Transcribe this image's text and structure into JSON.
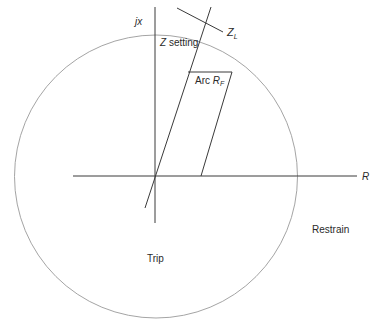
{
  "diagram": {
    "labels": {
      "jx_axis": "jx",
      "r_axis": "R",
      "z_setting_prefix": "Z",
      "z_setting_suffix": " setting",
      "zl_main": "Z",
      "zl_sub": "L",
      "arc_prefix": "Arc ",
      "arc_main": "R",
      "arc_sub": "F",
      "restrain": "Restrain",
      "trip": "Trip"
    },
    "colors": {
      "line": "#3a3a3a",
      "circle": "#9a9a9a",
      "background": "#ffffff"
    },
    "geometry": {
      "circle": {
        "cx": 156,
        "cy": 176.5,
        "r": 141.5
      },
      "origin": [
        155,
        176
      ],
      "r_axis": {
        "x1": 73,
        "x2": 357,
        "y": 176
      },
      "jx_axis": {
        "x": 155,
        "y1": 7,
        "y2": 223
      },
      "zl_line": {
        "x1": 145,
        "y1": 208,
        "x2": 211,
        "y2": 7
      },
      "zl_perpendicular": {
        "x1": 177,
        "y1": 8,
        "x2": 223,
        "y2": 32
      },
      "arc_top": {
        "x1": 188,
        "y1": 72,
        "x2": 232,
        "y2": 72
      },
      "arc_right": {
        "x1": 232,
        "y1": 72,
        "x2": 201,
        "y2": 176
      }
    }
  }
}
